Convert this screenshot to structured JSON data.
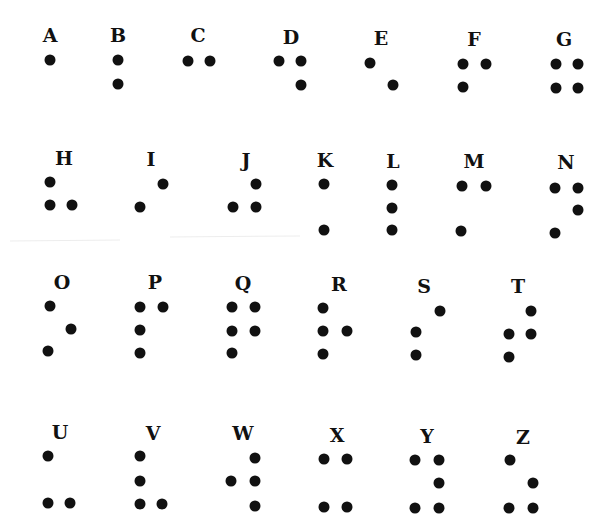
{
  "colors": {
    "ink": "#111111",
    "background": "#ffffff"
  },
  "cells": [
    {
      "letter": "A",
      "label": [
        50,
        35
      ],
      "dots": [
        [
          50,
          60
        ]
      ]
    },
    {
      "letter": "B",
      "label": [
        118,
        35
      ],
      "dots": [
        [
          118,
          60
        ],
        [
          118,
          84
        ]
      ]
    },
    {
      "letter": "C",
      "label": [
        198,
        35
      ],
      "dots": [
        [
          188,
          61
        ],
        [
          210,
          61
        ]
      ]
    },
    {
      "letter": "D",
      "label": [
        291,
        37
      ],
      "dots": [
        [
          279,
          61
        ],
        [
          301,
          61
        ],
        [
          301,
          85
        ]
      ]
    },
    {
      "letter": "E",
      "label": [
        381,
        38
      ],
      "dots": [
        [
          370,
          63
        ],
        [
          393,
          85
        ]
      ]
    },
    {
      "letter": "F",
      "label": [
        474,
        39
      ],
      "dots": [
        [
          463,
          64
        ],
        [
          486,
          64
        ],
        [
          463,
          87
        ]
      ]
    },
    {
      "letter": "G",
      "label": [
        564,
        39
      ],
      "dots": [
        [
          556,
          64
        ],
        [
          578,
          64
        ],
        [
          556,
          88
        ],
        [
          578,
          88
        ]
      ]
    },
    {
      "letter": "H",
      "label": [
        64,
        158
      ],
      "dots": [
        [
          50,
          182
        ],
        [
          50,
          205
        ],
        [
          72,
          205
        ]
      ]
    },
    {
      "letter": "I",
      "label": [
        151,
        159
      ],
      "dots": [
        [
          163,
          184
        ],
        [
          140,
          207
        ]
      ]
    },
    {
      "letter": "J",
      "label": [
        246,
        160
      ],
      "dots": [
        [
          256,
          184
        ],
        [
          233,
          207
        ],
        [
          256,
          207
        ]
      ]
    },
    {
      "letter": "K",
      "label": [
        325,
        160
      ],
      "dots": [
        [
          324,
          184
        ],
        [
          324,
          230
        ]
      ]
    },
    {
      "letter": "L",
      "label": [
        393,
        161
      ],
      "dots": [
        [
          392,
          185
        ],
        [
          392,
          208
        ],
        [
          392,
          230
        ]
      ]
    },
    {
      "letter": "M",
      "label": [
        474,
        161
      ],
      "dots": [
        [
          462,
          186
        ],
        [
          486,
          186
        ],
        [
          461,
          231
        ]
      ]
    },
    {
      "letter": "N",
      "label": [
        566,
        162
      ],
      "dots": [
        [
          555,
          188
        ],
        [
          578,
          188
        ],
        [
          578,
          210
        ],
        [
          555,
          233
        ]
      ]
    },
    {
      "letter": "O",
      "label": [
        62,
        282
      ],
      "dots": [
        [
          50,
          306
        ],
        [
          71,
          329
        ],
        [
          48,
          351
        ]
      ]
    },
    {
      "letter": "P",
      "label": [
        155,
        282
      ],
      "dots": [
        [
          140,
          307
        ],
        [
          163,
          307
        ],
        [
          140,
          330
        ],
        [
          140,
          353
        ]
      ]
    },
    {
      "letter": "Q",
      "label": [
        243,
        283
      ],
      "dots": [
        [
          232,
          307
        ],
        [
          255,
          307
        ],
        [
          232,
          331
        ],
        [
          255,
          331
        ],
        [
          232,
          353
        ]
      ]
    },
    {
      "letter": "R",
      "label": [
        339,
        284
      ],
      "dots": [
        [
          323,
          308
        ],
        [
          323,
          331
        ],
        [
          347,
          331
        ],
        [
          323,
          354
        ]
      ]
    },
    {
      "letter": "S",
      "label": [
        424,
        286
      ],
      "dots": [
        [
          440,
          311
        ],
        [
          416,
          332
        ],
        [
          416,
          355
        ]
      ]
    },
    {
      "letter": "T",
      "label": [
        518,
        286
      ],
      "dots": [
        [
          531,
          311
        ],
        [
          509,
          334
        ],
        [
          531,
          334
        ],
        [
          509,
          357
        ]
      ]
    },
    {
      "letter": "U",
      "label": [
        60,
        432
      ],
      "dots": [
        [
          48,
          456
        ],
        [
          48,
          503
        ],
        [
          70,
          503
        ]
      ]
    },
    {
      "letter": "V",
      "label": [
        153,
        433
      ],
      "dots": [
        [
          140,
          456
        ],
        [
          140,
          481
        ],
        [
          140,
          504
        ],
        [
          162,
          504
        ]
      ]
    },
    {
      "letter": "W",
      "label": [
        243,
        433
      ],
      "dots": [
        [
          255,
          458
        ],
        [
          231,
          481
        ],
        [
          255,
          481
        ],
        [
          255,
          506
        ]
      ]
    },
    {
      "letter": "X",
      "label": [
        337,
        435
      ],
      "dots": [
        [
          324,
          459
        ],
        [
          347,
          459
        ],
        [
          324,
          507
        ],
        [
          347,
          507
        ]
      ]
    },
    {
      "letter": "Y",
      "label": [
        427,
        436
      ],
      "dots": [
        [
          415,
          460
        ],
        [
          439,
          460
        ],
        [
          439,
          483
        ],
        [
          415,
          508
        ],
        [
          439,
          508
        ]
      ]
    },
    {
      "letter": "Z",
      "label": [
        523,
        437
      ],
      "dots": [
        [
          510,
          460
        ],
        [
          533,
          483
        ],
        [
          509,
          508
        ],
        [
          533,
          508
        ]
      ]
    }
  ]
}
